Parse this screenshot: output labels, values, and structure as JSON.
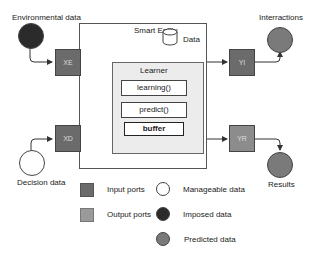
{
  "title": "Smart Entity",
  "data_store": {
    "label": "Data",
    "icon": "database-icon"
  },
  "learner": {
    "label": "Learner",
    "methods": [
      "learning()",
      "predict()"
    ],
    "buffer": "buffer"
  },
  "ports": {
    "XE": "XE",
    "XD": "XD",
    "YI": "YI",
    "YR": "YR"
  },
  "nodes": {
    "environmental": "Environmental data",
    "decision": "Decision data",
    "interactions": "Interractions",
    "results": "Results"
  },
  "legend": {
    "input_ports": "Input ports",
    "output_ports": "Output ports",
    "manageable": "Manageable data",
    "imposed": "Imposed data",
    "predicted": "Predicted data"
  },
  "colors": {
    "input_port": "#6b6b6b",
    "output_port": "#8c8c8c",
    "imposed": "#2b2b2b",
    "predicted": "#7a7a7a",
    "manageable": "#ffffff"
  }
}
